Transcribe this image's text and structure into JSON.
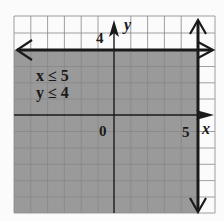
{
  "graph": {
    "inequalities": [
      "x ≤ 5",
      "y ≤ 4"
    ],
    "axis_labels": {
      "x": "x",
      "y": "y"
    },
    "tick_labels": {
      "origin": "0",
      "x_five": "5",
      "y_four": "4"
    },
    "boundaries": [
      {
        "line": "x = 5",
        "style": "solid",
        "shaded_side": "left"
      },
      {
        "line": "y = 4",
        "style": "solid",
        "shaded_side": "below"
      }
    ],
    "grid": {
      "x_range": [
        -6,
        6
      ],
      "y_range": [
        -6,
        6
      ],
      "unit_px": 16.8
    },
    "colors": {
      "background": "#fbfbfb",
      "shade": "#9a9a9a",
      "grid": "#777777",
      "line": "#1a1a1a"
    }
  }
}
